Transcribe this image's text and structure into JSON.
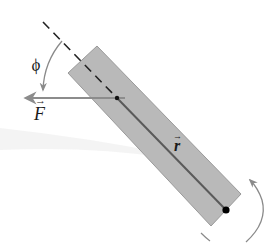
{
  "diagram": {
    "labels": {
      "angle": "ϕ",
      "force": "F",
      "radius": "r",
      "vector_arrow": "→"
    },
    "colors": {
      "bar_fill": "#b9b9b9",
      "bar_edge": "#9a9a9a",
      "force_arrow": "#8c8c8c",
      "radius_line": "#5a5a5a",
      "dashed_line": "#222222",
      "arc": "#8a8a8a",
      "pivot": "#000000"
    }
  }
}
